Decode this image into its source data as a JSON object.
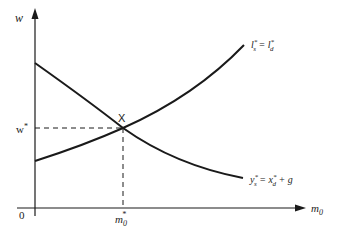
{
  "diagram": {
    "type": "economic-equilibrium-diagram",
    "axes": {
      "y_label": "w",
      "x_label": "m",
      "x_label_subscript": "0",
      "origin_label": "0"
    },
    "equilibrium": {
      "point_label": "X",
      "w_star_label": "w",
      "w_star_superscript": "*",
      "m_star_label": "m",
      "m_star_subscript": "0",
      "m_star_superscript": "*"
    },
    "curves": [
      {
        "id": "labour-market",
        "label_main": "l",
        "label_sup1": "*",
        "label_sub1": "s",
        "label_eq": " = ",
        "label_main2": "l",
        "label_sup2": "*",
        "label_sub2": "d",
        "slope": "upward"
      },
      {
        "id": "goods-market",
        "label_main": "y",
        "label_sup1": "*",
        "label_sub1": "s",
        "label_eq": " = ",
        "label_main2": "x",
        "label_sup2": "*",
        "label_sub2": "d",
        "label_tail": " + g",
        "slope": "downward"
      }
    ],
    "colors": {
      "line": "#1a1a1a",
      "text": "#222222",
      "background": "#ffffff"
    }
  }
}
